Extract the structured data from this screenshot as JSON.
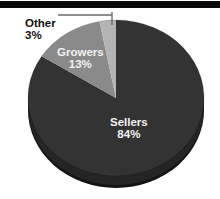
{
  "chart_data": {
    "type": "pie",
    "title": "",
    "subtitle": "",
    "xlabel": "",
    "ylabel": "",
    "legend_position": "none",
    "grid": false,
    "style": "3d-pie",
    "start_angle_deg": 0,
    "direction": "clockwise",
    "categories": [
      "Sellers",
      "Growers",
      "Other"
    ],
    "values": [
      84,
      13,
      3
    ],
    "value_unit": "%",
    "colors": [
      "#333333",
      "#8a8a8a",
      "#b4b4b4"
    ],
    "slices": [
      {
        "label": "Sellers",
        "value": 84,
        "display_value": "84%",
        "color": "#333333",
        "label_placement": "inside",
        "label_color": "#f2f2f2"
      },
      {
        "label": "Growers",
        "value": 13,
        "display_value": "13%",
        "color": "#8a8a8a",
        "label_placement": "inside",
        "label_color": "#f2f2f2"
      },
      {
        "label": "Other",
        "value": 3,
        "display_value": "3%",
        "color": "#b4b4b4",
        "label_placement": "outside",
        "label_color": "#111111",
        "has_leader_line": true
      }
    ]
  },
  "decor": {
    "top_rule_color": "#0b0b0b",
    "background_color": "#ffffff",
    "leader_line_color": "#6b6b6b",
    "pie_depth_color": "#1a1a1a"
  },
  "labels": {
    "other": {
      "name": "Other",
      "pct": "3%"
    },
    "growers": {
      "name": "Growers",
      "pct": "13%"
    },
    "sellers": {
      "name": "Sellers",
      "pct": "84%"
    }
  }
}
